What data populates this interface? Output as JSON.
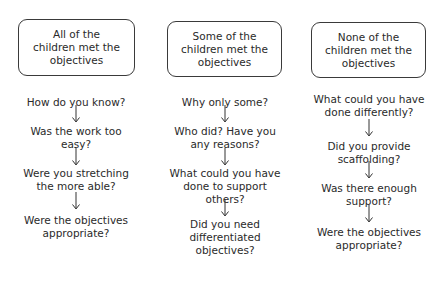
{
  "columns": [
    {
      "heading": "All of the children met the objectives",
      "heading_lines": [
        "All of the",
        "children met the",
        "objectives"
      ],
      "questions": [
        [
          "How do you know?"
        ],
        [
          "Was the work too",
          "easy?"
        ],
        [
          "Were you stretching",
          "the more able?"
        ],
        [
          "Were the objectives",
          "appropriate?"
        ]
      ]
    },
    {
      "heading": "Some of the children met the objectives",
      "heading_lines": [
        "Some of the",
        "children met the",
        "objectives"
      ],
      "questions": [
        [
          "Why only some?"
        ],
        [
          "Who did? Have you",
          "any reasons?"
        ],
        [
          "What could you have",
          "done to support",
          "others?"
        ],
        [
          "Did you need",
          "differentiated",
          "objectives?"
        ]
      ]
    },
    {
      "heading": "None of the children met the objectives",
      "heading_lines": [
        "None of the",
        "children met the",
        "objectives"
      ],
      "questions": [
        [
          "What could you have",
          "done differently?"
        ],
        [
          "Did you provide",
          "scaffolding?"
        ],
        [
          "Was there enough",
          "support?"
        ],
        [
          "Were the objectives",
          "appropriate?"
        ]
      ]
    }
  ]
}
